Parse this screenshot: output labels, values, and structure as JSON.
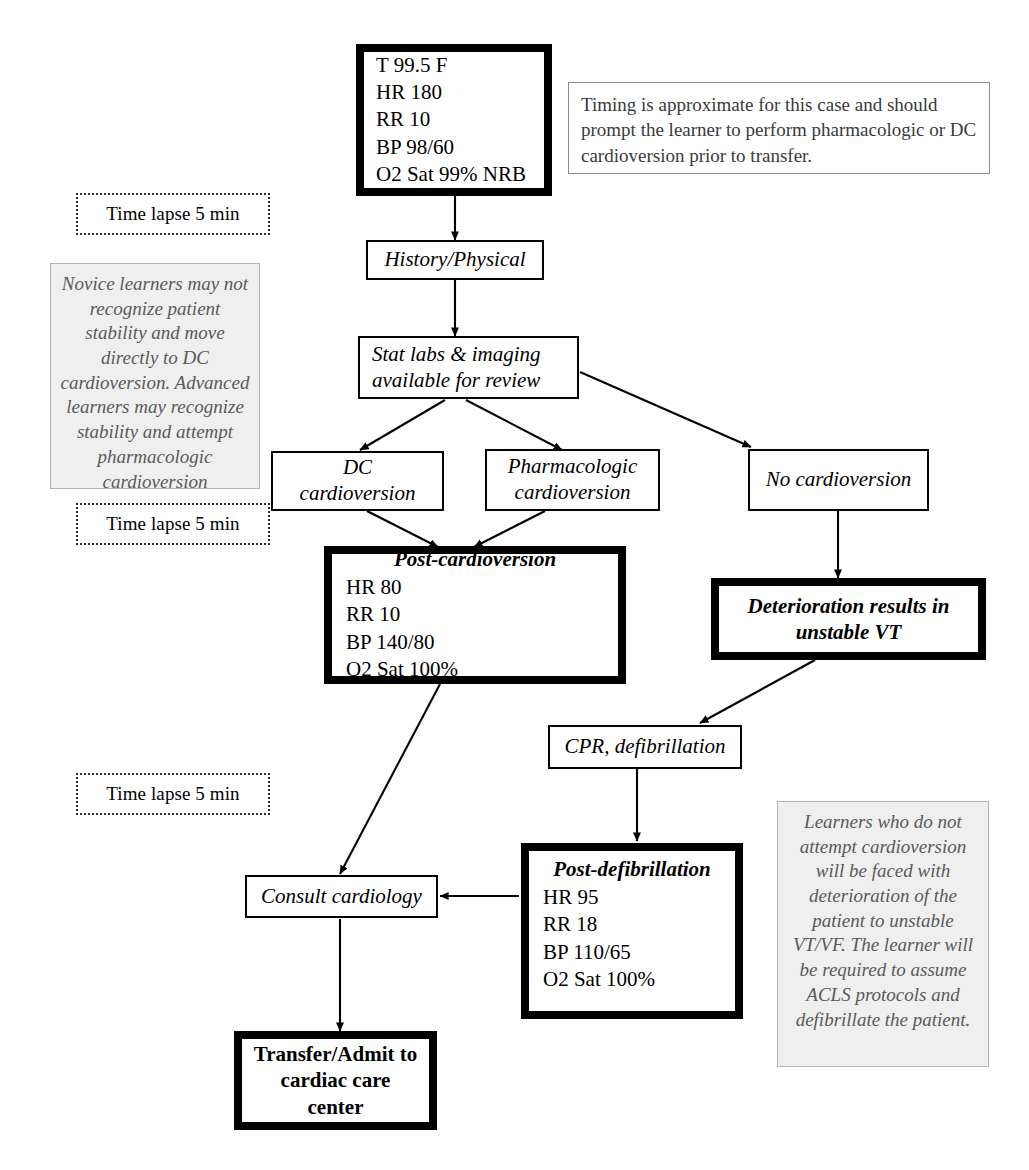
{
  "diagram": {
    "nodes": {
      "initial_vitals": {
        "lines": [
          "T 99.5 F",
          "HR 180",
          "RR 10",
          "BP 98/60",
          "O2 Sat 99% NRB"
        ]
      },
      "history_physical": {
        "label": "History/Physical"
      },
      "stat_labs": {
        "label": "Stat labs & imaging available for review"
      },
      "dc_cardioversion": {
        "label": "DC cardioversion"
      },
      "pharmacologic_cardioversion": {
        "label": "Pharmacologic cardioversion"
      },
      "no_cardioversion": {
        "label": "No cardioversion"
      },
      "post_cardioversion": {
        "title": "Post-cardioversion",
        "lines": [
          "HR 80",
          "RR 10",
          "BP 140/80",
          "O2 Sat 100%"
        ]
      },
      "deterioration": {
        "label": "Deterioration results in unstable VT"
      },
      "cpr_defibrillation": {
        "label": "CPR, defibrillation"
      },
      "post_defibrillation": {
        "title": "Post-defibrillation",
        "lines": [
          "HR 95",
          "RR 18",
          "BP 110/65",
          "O2 Sat 100%"
        ]
      },
      "consult_cardiology": {
        "label": "Consult cardiology"
      },
      "transfer_admit": {
        "label": "Transfer/Admit to cardiac care center"
      }
    },
    "time_lapse_labels": [
      "Time lapse 5 min",
      "Time lapse 5 min",
      "Time lapse 5 min"
    ],
    "notes": {
      "timing": "Timing is approximate for this case and should prompt the learner to perform pharmacologic or DC cardioversion prior to transfer.",
      "novice": "Novice learners may not recognize patient stability and move directly to DC cardioversion. Advanced learners may recognize stability and attempt pharmacologic cardioversion",
      "learners": "Learners who do not attempt cardioversion will be faced with deterioration of the patient to unstable VT/VF.  The learner will be required to assume ACLS protocols and defibrillate the patient."
    },
    "colors": {
      "ink": "#000000",
      "note_background": "#efefef",
      "note_text": "#5a5a5a",
      "page_background": "#ffffff"
    }
  }
}
